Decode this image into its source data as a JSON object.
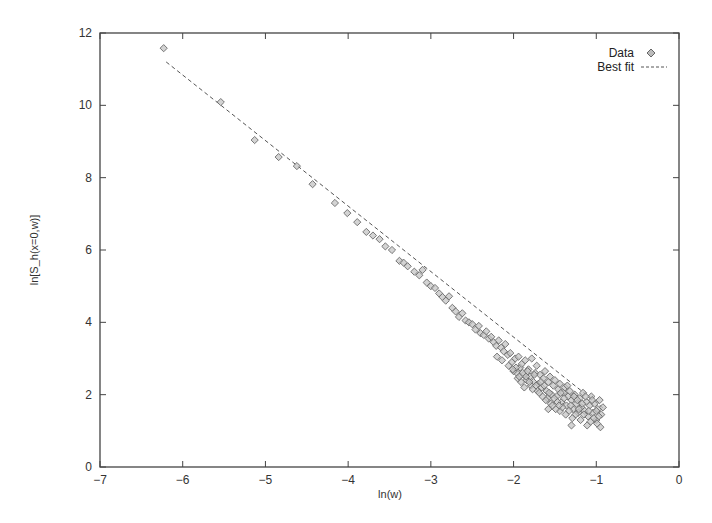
{
  "chart_data": {
    "type": "scatter",
    "title": "",
    "xlabel": "ln(w)",
    "ylabel": "ln[S_h(x=0,w)]",
    "xlim": [
      -7,
      0
    ],
    "ylim": [
      0,
      12
    ],
    "xticks": [
      -7,
      -6,
      -5,
      -4,
      -3,
      -2,
      -1,
      0
    ],
    "yticks": [
      0,
      2,
      4,
      6,
      8,
      10,
      12
    ],
    "grid": false,
    "legend_position": "top-right",
    "series": [
      {
        "name": "Data",
        "style": "diamond-markers",
        "color": "#888888",
        "points": [
          [
            -6.23,
            11.58
          ],
          [
            -5.54,
            10.09
          ],
          [
            -5.13,
            9.04
          ],
          [
            -4.84,
            8.57
          ],
          [
            -4.62,
            8.32
          ],
          [
            -4.43,
            7.82
          ],
          [
            -4.16,
            7.3
          ],
          [
            -4.01,
            7.02
          ],
          [
            -3.89,
            6.77
          ],
          [
            -3.78,
            6.5
          ],
          [
            -3.7,
            6.4
          ],
          [
            -3.62,
            6.3
          ],
          [
            -3.55,
            6.1
          ],
          [
            -3.47,
            6.0
          ],
          [
            -3.38,
            5.7
          ],
          [
            -3.33,
            5.65
          ],
          [
            -3.28,
            5.55
          ],
          [
            -3.2,
            5.4
          ],
          [
            -3.14,
            5.3
          ],
          [
            -3.1,
            5.45
          ],
          [
            -3.05,
            5.1
          ],
          [
            -3.0,
            5.0
          ],
          [
            -2.95,
            4.95
          ],
          [
            -2.9,
            4.8
          ],
          [
            -2.86,
            4.7
          ],
          [
            -2.82,
            4.6
          ],
          [
            -2.78,
            4.72
          ],
          [
            -2.74,
            4.4
          ],
          [
            -2.7,
            4.3
          ],
          [
            -2.66,
            4.15
          ],
          [
            -2.62,
            4.25
          ],
          [
            -2.58,
            4.05
          ],
          [
            -2.54,
            4.0
          ],
          [
            -2.5,
            3.95
          ],
          [
            -2.46,
            3.8
          ],
          [
            -2.42,
            3.9
          ],
          [
            -2.4,
            3.7
          ],
          [
            -2.36,
            3.65
          ],
          [
            -2.33,
            3.75
          ],
          [
            -2.3,
            3.55
          ],
          [
            -2.27,
            3.6
          ],
          [
            -2.24,
            3.45
          ],
          [
            -2.21,
            3.35
          ],
          [
            -2.18,
            3.5
          ],
          [
            -2.15,
            3.3
          ],
          [
            -2.12,
            3.2
          ],
          [
            -2.1,
            3.4
          ],
          [
            -2.07,
            3.1
          ],
          [
            -2.04,
            3.15
          ],
          [
            -2.02,
            2.9
          ],
          [
            -1.98,
            3.0
          ],
          [
            -1.96,
            2.6
          ],
          [
            -1.94,
            3.05
          ],
          [
            -1.92,
            2.75
          ],
          [
            -1.9,
            2.85
          ],
          [
            -1.88,
            2.55
          ],
          [
            -1.86,
            2.95
          ],
          [
            -1.84,
            2.4
          ],
          [
            -1.82,
            2.7
          ],
          [
            -1.8,
            2.5
          ],
          [
            -1.78,
            3.0
          ],
          [
            -1.76,
            2.35
          ],
          [
            -1.74,
            2.6
          ],
          [
            -1.72,
            2.8
          ],
          [
            -1.7,
            2.3
          ],
          [
            -1.68,
            2.55
          ],
          [
            -1.66,
            2.2
          ],
          [
            -1.64,
            2.45
          ],
          [
            -1.62,
            2.65
          ],
          [
            -1.6,
            2.1
          ],
          [
            -1.58,
            2.35
          ],
          [
            -1.56,
            2.5
          ],
          [
            -1.54,
            2.0
          ],
          [
            -1.52,
            2.25
          ],
          [
            -1.5,
            2.4
          ],
          [
            -1.48,
            1.95
          ],
          [
            -1.46,
            2.15
          ],
          [
            -1.44,
            2.3
          ],
          [
            -1.42,
            1.8
          ],
          [
            -1.4,
            2.05
          ],
          [
            -1.38,
            2.2
          ],
          [
            -1.36,
            1.7
          ],
          [
            -1.34,
            1.95
          ],
          [
            -1.32,
            2.1
          ],
          [
            -1.3,
            1.85
          ],
          [
            -1.28,
            1.6
          ],
          [
            -1.26,
            2.0
          ],
          [
            -1.24,
            1.75
          ],
          [
            -1.22,
            1.5
          ],
          [
            -1.2,
            1.9
          ],
          [
            -1.18,
            1.65
          ],
          [
            -1.16,
            2.05
          ],
          [
            -1.14,
            1.55
          ],
          [
            -1.12,
            1.8
          ],
          [
            -1.1,
            1.4
          ],
          [
            -1.08,
            1.7
          ],
          [
            -1.06,
            1.95
          ],
          [
            -1.04,
            1.5
          ],
          [
            -1.02,
            1.75
          ],
          [
            -1.0,
            1.3
          ],
          [
            -0.98,
            1.6
          ],
          [
            -0.96,
            1.85
          ],
          [
            -0.94,
            1.45
          ],
          [
            -0.92,
            1.65
          ],
          [
            -0.95,
            1.1
          ],
          [
            -0.99,
            1.2
          ],
          [
            -1.03,
            1.35
          ],
          [
            -1.07,
            1.25
          ],
          [
            -1.11,
            1.15
          ],
          [
            -1.15,
            1.45
          ],
          [
            -1.19,
            1.3
          ],
          [
            -1.23,
            1.85
          ],
          [
            -1.27,
            1.95
          ],
          [
            -1.31,
            1.7
          ],
          [
            -1.35,
            2.25
          ],
          [
            -1.39,
            1.9
          ],
          [
            -1.43,
            2.05
          ],
          [
            -1.47,
            1.8
          ],
          [
            -1.51,
            1.9
          ],
          [
            -1.55,
            1.75
          ],
          [
            -1.59,
            1.9
          ],
          [
            -1.63,
            2.25
          ],
          [
            -1.67,
            2.35
          ],
          [
            -1.71,
            2.1
          ],
          [
            -1.75,
            2.55
          ],
          [
            -1.79,
            2.25
          ],
          [
            -1.83,
            2.65
          ],
          [
            -1.87,
            2.2
          ],
          [
            -1.91,
            2.35
          ],
          [
            -1.95,
            2.45
          ],
          [
            -2.0,
            2.65
          ],
          [
            -2.06,
            2.8
          ],
          [
            -2.14,
            2.95
          ],
          [
            -2.2,
            3.05
          ],
          [
            -1.3,
            1.15
          ],
          [
            -1.44,
            1.55
          ],
          [
            -1.58,
            1.6
          ],
          [
            -1.0,
            1.55
          ],
          [
            -0.97,
            1.4
          ],
          [
            -1.05,
            1.85
          ],
          [
            -1.09,
            1.55
          ],
          [
            -1.13,
            1.95
          ],
          [
            -1.17,
            1.75
          ],
          [
            -1.21,
            1.6
          ],
          [
            -1.25,
            1.45
          ],
          [
            -1.29,
            1.35
          ],
          [
            -1.33,
            1.55
          ],
          [
            -1.37,
            1.45
          ],
          [
            -1.41,
            1.65
          ],
          [
            -1.45,
            1.7
          ],
          [
            -1.49,
            1.6
          ],
          [
            -1.53,
            1.7
          ],
          [
            -1.57,
            2.05
          ],
          [
            -1.61,
            1.85
          ],
          [
            -1.65,
            1.95
          ],
          [
            -1.69,
            2.05
          ],
          [
            -1.73,
            2.25
          ],
          [
            -1.77,
            2.15
          ],
          [
            -1.81,
            2.35
          ],
          [
            -1.85,
            2.5
          ],
          [
            -1.89,
            2.6
          ],
          [
            -1.93,
            2.5
          ],
          [
            -1.97,
            2.75
          ],
          [
            -2.01,
            2.7
          ]
        ]
      },
      {
        "name": "Best fit",
        "style": "dashed-line",
        "color": "#555555",
        "points": [
          [
            -6.2,
            11.2
          ],
          [
            -0.9,
            1.6
          ]
        ]
      }
    ]
  },
  "axes": {
    "xlabel": "ln(w)",
    "ylabel": "ln[S_h(x=0,w)]",
    "xtick_labels": [
      "−7",
      "−6",
      "−5",
      "−4",
      "−3",
      "−2",
      "−1",
      "0"
    ],
    "ytick_labels": [
      "0",
      "2",
      "4",
      "6",
      "8",
      "10",
      "12"
    ]
  },
  "legend": {
    "items": [
      {
        "label": "Data",
        "icon": "diamond-marker-icon"
      },
      {
        "label": "Best fit",
        "icon": "dashed-line-icon"
      }
    ]
  }
}
